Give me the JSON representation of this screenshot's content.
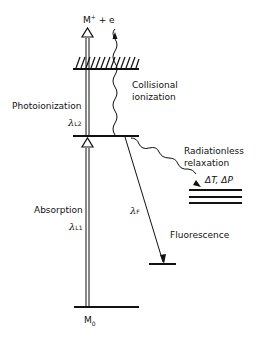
{
  "diagram": {
    "top_label": {
      "base": "M",
      "sup": "+",
      "rest": " + e"
    },
    "photoionization": "Photoionization",
    "collisional_1": "Collisional",
    "collisional_2": "ionization",
    "lambda_l2": {
      "sym": "λ",
      "sub": "L2"
    },
    "radiationless_1": "Radiationless",
    "radiationless_2": "relaxation",
    "delta_tp": "ΔT, ΔP",
    "absorption": "Absorption",
    "lambda_l1": {
      "sym": "λ",
      "sub": "L1"
    },
    "lambda_f": {
      "sym": "λ",
      "sub": "F"
    },
    "fluorescence": "Fluorescence",
    "ground": {
      "base": "M",
      "sub": "0"
    }
  }
}
